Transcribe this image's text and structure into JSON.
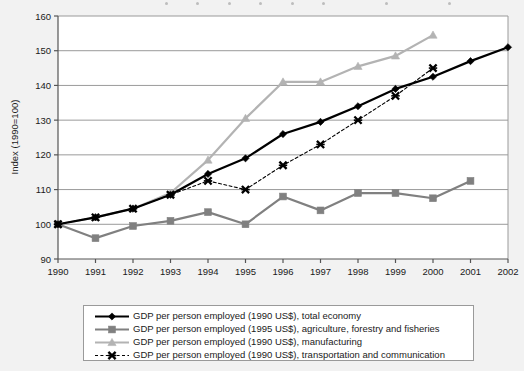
{
  "chart_data": {
    "type": "line",
    "title": "",
    "xlabel": "",
    "ylabel": "Index (1990=100)",
    "x": [
      1990,
      1991,
      1992,
      1993,
      1994,
      1995,
      1996,
      1997,
      1998,
      1999,
      2000,
      2001,
      2002
    ],
    "xticklabels": [
      "1990",
      "1991",
      "1992",
      "1993",
      "1994",
      "1995",
      "1996",
      "1997",
      "1998",
      "1999",
      "2000",
      "2001",
      "2002"
    ],
    "xlim": [
      1990,
      2002
    ],
    "ylim": [
      90,
      160
    ],
    "yticks": [
      90,
      100,
      110,
      120,
      130,
      140,
      150,
      160
    ],
    "yticklabels": [
      "90",
      "100",
      "110",
      "120",
      "130",
      "140",
      "150",
      "160"
    ],
    "grid": true,
    "legend_position": "below",
    "series": [
      {
        "name": "GDP per person employed (1990 US$), total economy",
        "color": "#000000",
        "marker": "diamond",
        "linestyle": "solid",
        "x": [
          1990,
          1991,
          1992,
          1993,
          1994,
          1995,
          1996,
          1997,
          1998,
          1999,
          2000,
          2001,
          2002
        ],
        "values": [
          100,
          102,
          104.5,
          108.5,
          114.5,
          119,
          126,
          129.5,
          134,
          139,
          142.5,
          147,
          151
        ]
      },
      {
        "name": "GDP per person employed (1995 US$), agriculture, forestry and fisheries",
        "color": "#808080",
        "marker": "square",
        "linestyle": "solid",
        "x": [
          1990,
          1991,
          1992,
          1993,
          1994,
          1995,
          1996,
          1997,
          1998,
          1999,
          2000,
          2001
        ],
        "values": [
          100,
          96,
          99.5,
          101,
          103.5,
          100,
          108,
          104,
          109,
          109,
          107.5,
          112.5
        ]
      },
      {
        "name": "GDP per person employed (1990 US$), manufacturing",
        "color": "#b3b3b3",
        "marker": "triangle",
        "linestyle": "solid",
        "x": [
          1990,
          1991,
          1992,
          1993,
          1994,
          1995,
          1996,
          1997,
          1998,
          1999,
          2000
        ],
        "values": [
          100,
          102,
          104.5,
          109,
          118.5,
          130.5,
          141,
          141,
          145.5,
          148.5,
          154.5
        ]
      },
      {
        "name": "GDP per person employed (1990 US$), transportation and communication",
        "color": "#000000",
        "marker": "cross",
        "linestyle": "dashed",
        "x": [
          1990,
          1991,
          1992,
          1993,
          1994,
          1995,
          1996,
          1997,
          1998,
          1999,
          2000
        ],
        "values": [
          100,
          102,
          104.5,
          108.5,
          112.5,
          110,
          117,
          123,
          130,
          137,
          145
        ]
      }
    ]
  }
}
